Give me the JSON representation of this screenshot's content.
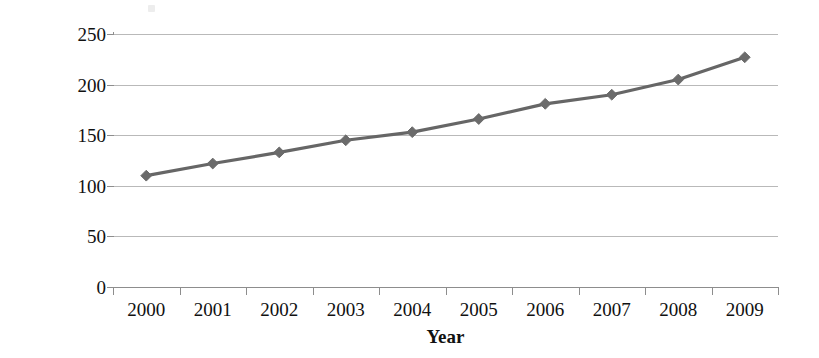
{
  "chart_data": {
    "type": "line",
    "title": "",
    "xlabel": "Year",
    "ylabel": "Vehicles/1000 persons",
    "categories": [
      "2000",
      "2001",
      "2002",
      "2003",
      "2004",
      "2005",
      "2006",
      "2007",
      "2008",
      "2009"
    ],
    "values": [
      110,
      122,
      133,
      145,
      153,
      166,
      181,
      190,
      205,
      227
    ],
    "series": [
      {
        "name": "Vehicles per 1000 persons",
        "values": [
          110,
          122,
          133,
          145,
          153,
          166,
          181,
          190,
          205,
          227
        ]
      }
    ],
    "ylim": [
      0,
      250
    ],
    "yticks": [
      0,
      50,
      100,
      150,
      200,
      250
    ],
    "ytick_labels": [
      "0",
      "50",
      "100",
      "150",
      "200",
      "250"
    ],
    "xtick_labels": [
      "2000",
      "2001",
      "2002",
      "2003",
      "2004",
      "2005",
      "2006",
      "2007",
      "2008",
      "2009"
    ],
    "grid": "horizontal",
    "legend": "none",
    "line_color": "#666666",
    "marker_color": "#6b6b6b",
    "marker_shape": "diamond",
    "gridline_color": "#b9b9b9",
    "axis_color": "#8d8d8d",
    "background_color": "#ffffff"
  }
}
